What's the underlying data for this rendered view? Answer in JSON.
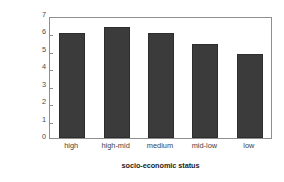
{
  "chart_data": {
    "type": "bar",
    "title": "",
    "categories": [
      "high",
      "high-mid",
      "medium",
      "mid-low",
      "low"
    ],
    "values": [
      6.0,
      6.35,
      6.05,
      5.4,
      4.8
    ],
    "xlabel": "socio-economic status",
    "ylabel": "age-adjusted incidence (per 100,000)",
    "ylabel_line1": "age-adjusted incidence",
    "ylabel_line2": "(per 100,000)",
    "ylim": [
      0,
      7
    ],
    "ytick_labels": [
      "0",
      "1",
      "2",
      "3",
      "4",
      "5",
      "6",
      "7"
    ],
    "ytick_values": [
      0,
      1,
      2,
      3,
      4,
      5,
      6,
      7
    ],
    "grid": false,
    "legend": false,
    "bar_color": "#3b3b3b",
    "frame_color": "#8e8e8e",
    "background_color": "#ffffff"
  },
  "axes": {
    "y": {
      "t0": "0",
      "t1": "1",
      "t2": "2",
      "t3": "3",
      "t4": "4",
      "t5": "5",
      "t6": "6",
      "t7": "7"
    },
    "x": {
      "c0": "high",
      "c1": "high-mid",
      "c2": "medium",
      "c3": "mid-low",
      "c4": "low"
    }
  }
}
